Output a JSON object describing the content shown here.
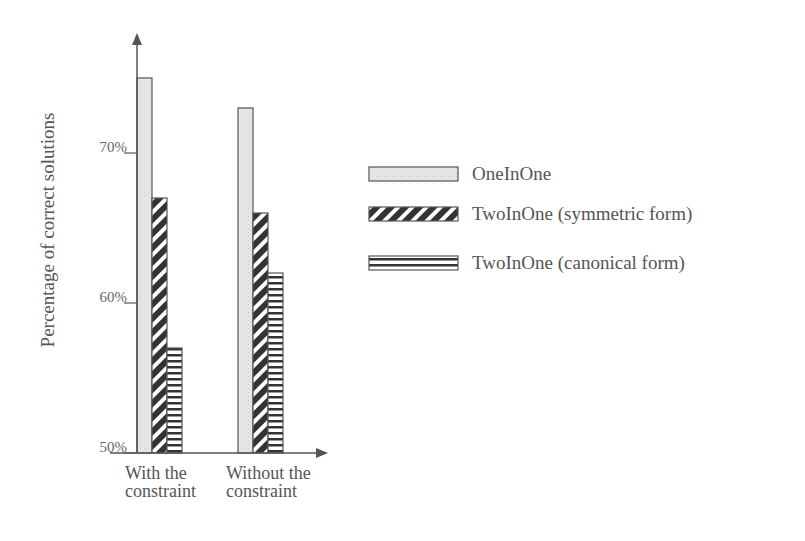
{
  "chart_data": {
    "type": "bar",
    "title": "",
    "xlabel": "",
    "ylabel": "Percentage of correct solutions",
    "categories": [
      [
        "With the",
        "constraint"
      ],
      [
        "Without the",
        "constraint"
      ]
    ],
    "category_labels": [
      "With the constraint",
      "Without the constraint"
    ],
    "series": [
      {
        "name": "OneInOne",
        "pattern": "dotted-gray",
        "values": [
          75,
          73
        ]
      },
      {
        "name": "TwoInOne (symmetric form)",
        "pattern": "diagonal-stripes",
        "values": [
          67,
          66
        ]
      },
      {
        "name": "TwoInOne (canonical form)",
        "pattern": "horizontal-stripes",
        "values": [
          57,
          62
        ]
      }
    ],
    "ylim": [
      50,
      78
    ],
    "yticks": [
      50,
      60,
      70
    ],
    "ytick_labels": [
      "50%",
      "60%",
      "70%"
    ],
    "grid": false,
    "legend_position": "right"
  },
  "colors": {
    "axis": "#555555",
    "onein_fill": "#e6e6e6",
    "stripe_dark": "#333333",
    "bar_outline": "#555555"
  }
}
